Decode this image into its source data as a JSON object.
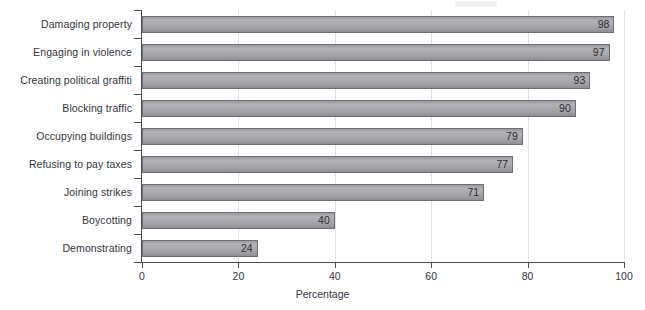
{
  "chart_data": {
    "type": "bar",
    "orientation": "horizontal",
    "title": "",
    "subtitle": "",
    "xlabel": "Percentage",
    "ylabel": "",
    "xlim": [
      0,
      100
    ],
    "xticks": [
      0,
      20,
      40,
      60,
      80,
      100
    ],
    "xtick_labels": [
      "0",
      "20",
      "40",
      "60",
      "80",
      "100"
    ],
    "grid": "vertical-faint",
    "legend": "none",
    "bar_fill_color": "#a9a9ad",
    "bar_edge_color": "#6e6e74",
    "axis_color": "#4a4a52",
    "text_color": "#33333b",
    "categories": [
      "Damaging property",
      "Engaging in violence",
      "Creating political graffiti",
      "Blocking traffic",
      "Occupying buildings",
      "Refusing to pay taxes",
      "Joining strikes",
      "Boycotting",
      "Demonstrating"
    ],
    "values": [
      98,
      97,
      93,
      90,
      79,
      77,
      71,
      40,
      24
    ],
    "value_labels": [
      "98",
      "97",
      "93",
      "90",
      "79",
      "77",
      "71",
      "40",
      "24"
    ],
    "bars": [
      {
        "category": "Damaging property",
        "value": 98,
        "label": "98"
      },
      {
        "category": "Engaging in violence",
        "value": 97,
        "label": "97"
      },
      {
        "category": "Creating political graffiti",
        "value": 93,
        "label": "93"
      },
      {
        "category": "Blocking traffic",
        "value": 90,
        "label": "90"
      },
      {
        "category": "Occupying buildings",
        "value": 79,
        "label": "79"
      },
      {
        "category": "Refusing to pay taxes",
        "value": 77,
        "label": "77"
      },
      {
        "category": "Joining strikes",
        "value": 71,
        "label": "71"
      },
      {
        "category": "Boycotting",
        "value": 40,
        "label": "40"
      },
      {
        "category": "Demonstrating",
        "value": 24,
        "label": "24"
      }
    ]
  }
}
